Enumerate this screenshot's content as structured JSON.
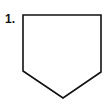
{
  "figure": {
    "label": "1.",
    "shape": {
      "type": "pentagon",
      "description": "house-shaped pentagon pointing downward",
      "points": "23,15 101,15 101,72 63,98 23,71",
      "stroke": "#111111",
      "fill": "#ffffff",
      "stroke_width": 1.6
    }
  }
}
